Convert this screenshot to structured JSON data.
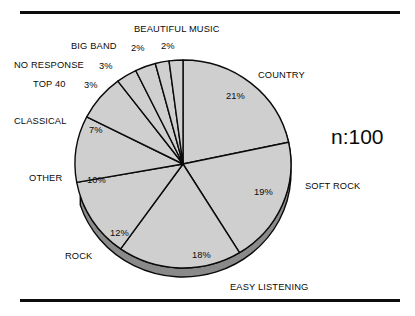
{
  "figure": {
    "background_color": "#ffffff",
    "rule_color": "#0d0d0d",
    "annotation": "n:100"
  },
  "labels": {
    "beautiful_music": "BEAUTIFUL MUSIC",
    "big_band": "BIG BAND",
    "no_response": "NO RESPONSE",
    "top_40": "TOP 40",
    "classical": "CLASSICAL",
    "other": "OTHER",
    "rock": "ROCK",
    "easy_listening": "EASY LISTENING",
    "soft_rock": "SOFT ROCK",
    "country": "COUNTRY"
  },
  "percent_labels": {
    "beautiful_music": "2%",
    "big_band": "2%",
    "no_response": "3%",
    "top_40": "3%",
    "classical": "7%",
    "other": "10%",
    "rock": "12%",
    "easy_listening": "18%",
    "soft_rock": "19%",
    "country": "21%"
  },
  "chart_data": {
    "type": "pie",
    "title": "",
    "subtitle": "",
    "xlabel": "",
    "ylabel": "",
    "annotation": "n:100",
    "sample_size": 100,
    "units": "percent",
    "total": 97,
    "start_angle_deg": 0,
    "direction": "clockwise",
    "three_d": true,
    "legend_position": "outside-labels",
    "grid": false,
    "slice_fill_color": "#cfcfcf",
    "slice_edge_color": "#0a0a0a",
    "depth_shadow_color": "#8a8a8a",
    "categories": [
      "COUNTRY",
      "SOFT ROCK",
      "EASY LISTENING",
      "ROCK",
      "OTHER",
      "CLASSICAL",
      "TOP 40",
      "NO RESPONSE",
      "BIG BAND",
      "BEAUTIFUL MUSIC"
    ],
    "values": [
      21,
      19,
      18,
      12,
      10,
      7,
      3,
      3,
      2,
      2
    ],
    "labels_formatted": [
      "21%",
      "19%",
      "18%",
      "12%",
      "10%",
      "7%",
      "3%",
      "3%",
      "2%",
      "2%"
    ],
    "slices": [
      {
        "name": "COUNTRY",
        "value": 21,
        "label": "21%"
      },
      {
        "name": "SOFT ROCK",
        "value": 19,
        "label": "19%"
      },
      {
        "name": "EASY LISTENING",
        "value": 18,
        "label": "18%"
      },
      {
        "name": "ROCK",
        "value": 12,
        "label": "12%"
      },
      {
        "name": "OTHER",
        "value": 10,
        "label": "10%"
      },
      {
        "name": "CLASSICAL",
        "value": 7,
        "label": "7%"
      },
      {
        "name": "TOP 40",
        "value": 3,
        "label": "3%"
      },
      {
        "name": "NO RESPONSE",
        "value": 3,
        "label": "3%"
      },
      {
        "name": "BIG BAND",
        "value": 2,
        "label": "2%"
      },
      {
        "name": "BEAUTIFUL MUSIC",
        "value": 2,
        "label": "2%"
      }
    ]
  }
}
